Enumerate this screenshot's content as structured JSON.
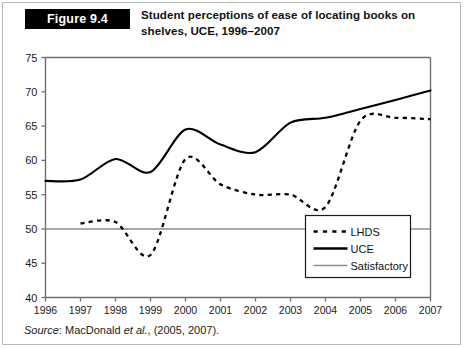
{
  "figure": {
    "badge_label": "Figure 9.4",
    "title": "Student perceptions of ease of locating books on shelves, UCE, 1996–2007",
    "title_line1": "Student perceptions of ease of locating books on",
    "title_line2": "shelves, UCE, 1996–2007"
  },
  "source": {
    "label": "Source",
    "separator": ": ",
    "author": "MacDonald ",
    "etal": "et al.",
    "rest": ", (2005, 2007)."
  },
  "colors": {
    "uce_line": "#000000",
    "lhds_line": "#000000",
    "satisfactory_line": "#8c8c8c",
    "axis": "#6e6e6e",
    "badge_bg": "#000000",
    "badge_text": "#ffffff",
    "frame": "#b9b9b9",
    "background": "#ffffff"
  },
  "chart_data": {
    "type": "line",
    "title": "Student perceptions of ease of locating books on shelves, UCE, 1996–2007",
    "xlabel": "",
    "ylabel": "",
    "x": [
      1996,
      1997,
      1998,
      1999,
      2000,
      2001,
      2002,
      2003,
      2004,
      2005,
      2006,
      2007
    ],
    "categories": [
      "1996",
      "1997",
      "1998",
      "1999",
      "2000",
      "2001",
      "2002",
      "2003",
      "2004",
      "2005",
      "2006",
      "2007"
    ],
    "xlim": [
      1996,
      2007
    ],
    "ylim": [
      40,
      75
    ],
    "yticks": [
      40,
      45,
      50,
      55,
      60,
      65,
      70,
      75
    ],
    "ytick_labels": [
      "40",
      "45",
      "50",
      "55",
      "60",
      "65",
      "70",
      "75"
    ],
    "grid": false,
    "legend_position": "lower-right",
    "series": [
      {
        "name": "LHDS",
        "style": "dotted",
        "color": "#000000",
        "x": [
          1997,
          1998,
          1999,
          2000,
          2001,
          2002,
          2003,
          2004,
          2005,
          2006,
          2007
        ],
        "values": [
          50.8,
          51.0,
          46.2,
          60.2,
          56.5,
          55.0,
          55.0,
          53.2,
          65.8,
          66.2,
          66.0
        ]
      },
      {
        "name": "UCE",
        "style": "solid",
        "color": "#000000",
        "x": [
          1996,
          1997,
          1998,
          1999,
          2000,
          2001,
          2002,
          2003,
          2004,
          2005,
          2006,
          2007
        ],
        "values": [
          57.0,
          57.2,
          60.2,
          58.3,
          64.5,
          62.3,
          61.2,
          65.5,
          66.2,
          67.5,
          68.8,
          70.2
        ]
      },
      {
        "name": "Satisfactory",
        "style": "solid-gray",
        "color": "#8c8c8c",
        "x": [
          1996,
          2007
        ],
        "values": [
          50,
          50
        ]
      }
    ],
    "legend": [
      {
        "label": "LHDS",
        "style": "dotted",
        "color": "#000000"
      },
      {
        "label": "UCE",
        "style": "solid",
        "color": "#000000"
      },
      {
        "label": "Satisfactory",
        "style": "solid-gray",
        "color": "#8c8c8c"
      }
    ]
  }
}
